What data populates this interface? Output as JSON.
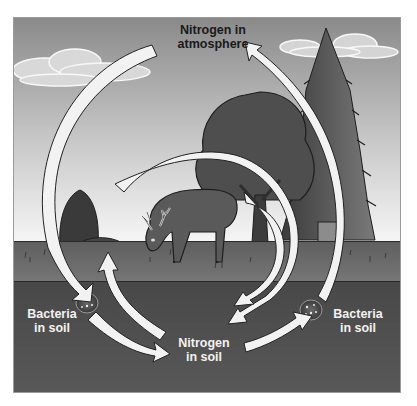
{
  "labels": {
    "atmosphere": {
      "line1": "Nitrogen in",
      "line2": "atmosphere"
    },
    "bacteria_left": {
      "line1": "Bacteria",
      "line2": "in soil"
    },
    "bacteria_right": {
      "line1": "Bacteria",
      "line2": "in soil"
    },
    "soil": {
      "line1": "Nitrogen",
      "line2": "in soil"
    }
  },
  "illustration": {
    "elements": [
      "sky",
      "clouds",
      "pine-tree",
      "deciduous-tree",
      "shrub",
      "deer",
      "grass",
      "soil",
      "bacteria-left",
      "bacteria-right",
      "cycle-arrows"
    ]
  },
  "colors": {
    "sky_top": "#8a8a8a",
    "sky_bottom": "#f4f4f4",
    "grass": "#6b6b6b",
    "soil": "#4f4f4f",
    "arrow_fill": "#f2f2f2",
    "arrow_stroke": "#2a2a2a"
  }
}
